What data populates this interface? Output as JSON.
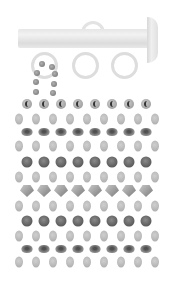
{
  "image": {
    "subject": "curtain rod with rings and beaded curtain strands",
    "palette": {
      "background": "#ffffff",
      "rod": "#e6e6e6",
      "ring": "#dddddd",
      "light_bead": "#bdbdbd",
      "dark_bead": "#5a5a5a"
    },
    "rod": {
      "rings_below": 3,
      "ring_on_top": 1,
      "finial": "right"
    },
    "bead_rows": [
      {
        "type": "c-bead",
        "count": 8,
        "y": 104
      },
      {
        "type": "oval",
        "count": 9,
        "y": 119
      },
      {
        "type": "rondelle",
        "count": 8,
        "y": 132
      },
      {
        "type": "oval",
        "count": 9,
        "y": 146
      },
      {
        "type": "dark-round",
        "count": 8,
        "y": 162
      },
      {
        "type": "oval",
        "count": 9,
        "y": 177
      },
      {
        "type": "bicone",
        "count": 8,
        "y": 191
      },
      {
        "type": "oval",
        "count": 9,
        "y": 206
      },
      {
        "type": "dark-round",
        "count": 8,
        "y": 221
      },
      {
        "type": "oval",
        "count": 9,
        "y": 236
      },
      {
        "type": "rondelle",
        "count": 8,
        "y": 249
      },
      {
        "type": "oval",
        "count": 9,
        "y": 262
      }
    ]
  }
}
